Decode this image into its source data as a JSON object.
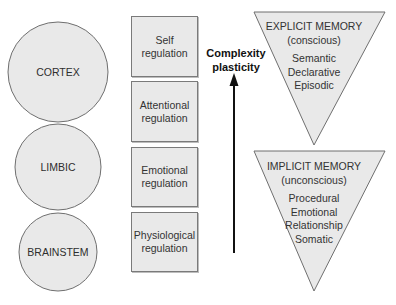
{
  "brain_regions": [
    {
      "label": "CORTEX"
    },
    {
      "label": "LIMBIC"
    },
    {
      "label": "BRAINSTEM"
    }
  ],
  "regulation_levels": [
    {
      "line1": "Self",
      "line2": "regulation"
    },
    {
      "line1": "Attentional",
      "line2": "regulation"
    },
    {
      "line1": "Emotional",
      "line2": "regulation"
    },
    {
      "line1": "Physiological",
      "line2": "regulation"
    }
  ],
  "arrow": {
    "line1": "Complexity",
    "line2": "plasticity",
    "direction": "up"
  },
  "memory": {
    "explicit": {
      "title": "EXPLICIT MEMORY",
      "subtitle": "(conscious)",
      "items": [
        "Semantic",
        "Declarative",
        "Episodic"
      ]
    },
    "implicit": {
      "title": "IMPLICIT MEMORY",
      "subtitle": "(unconscious)",
      "items": [
        "Procedural",
        "Emotional",
        "Relationship",
        "Somatic"
      ]
    }
  },
  "colors": {
    "shape_fill": "#e9e9e9",
    "shape_stroke": "#6f6f6f",
    "arrow": "#111111"
  }
}
